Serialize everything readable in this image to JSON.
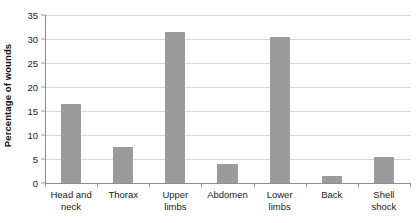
{
  "chart_data": {
    "type": "bar",
    "title": "",
    "xlabel": "",
    "ylabel": "Percentage of wounds",
    "ylim": [
      0,
      35
    ],
    "ytick_step": 5,
    "yticks": [
      "0",
      "5",
      "10",
      "15",
      "20",
      "25",
      "30",
      "35"
    ],
    "grid": true,
    "legend": "none",
    "bar_color": "#9b9b9b",
    "gridline_color": "#d8d8d8",
    "axis_color": "#8d8d8d",
    "background_color": "#ffffff",
    "categories": [
      "Head and neck",
      "Thorax",
      "Upper limbs",
      "Abdomen",
      "Lower limbs",
      "Back",
      "Shell shock"
    ],
    "category_lines": [
      [
        "Head and",
        "neck"
      ],
      [
        "Thorax",
        ""
      ],
      [
        "Upper",
        "limbs"
      ],
      [
        "Abdomen",
        ""
      ],
      [
        "Lower",
        "limbs"
      ],
      [
        "Back",
        ""
      ],
      [
        "Shell",
        "shock"
      ]
    ],
    "values": [
      16.5,
      7.5,
      31.5,
      4.0,
      30.5,
      1.5,
      5.5
    ]
  }
}
